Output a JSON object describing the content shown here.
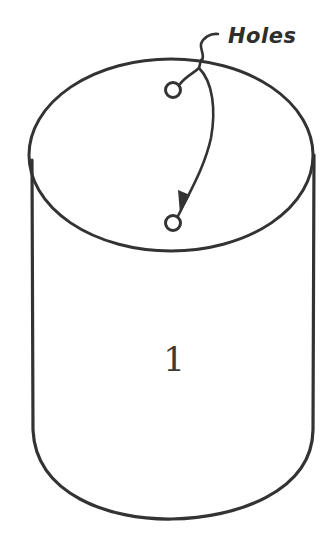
{
  "diagram": {
    "type": "cylinder-sketch",
    "stroke_color": "#333333",
    "background": "#ffffff",
    "callout": {
      "label": "Holes",
      "targets": [
        "hole-upper",
        "hole-lower"
      ]
    },
    "body_label": "1",
    "parts": [
      {
        "name": "top-ellipse",
        "description": "Top face of cylinder"
      },
      {
        "name": "cylinder-side",
        "description": "Cylinder walls with rounded bottom"
      },
      {
        "name": "hole-upper",
        "description": "Small circular hole near back of top face"
      },
      {
        "name": "hole-lower",
        "description": "Small circular hole near front of top face"
      }
    ]
  }
}
